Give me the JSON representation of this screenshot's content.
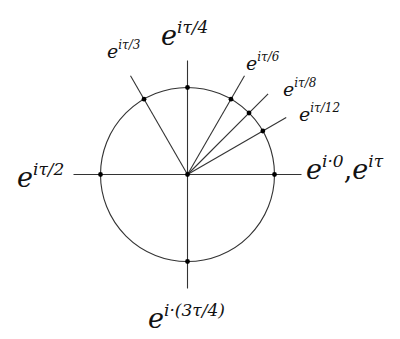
{
  "diagram": {
    "center": {
      "x": 187.5,
      "y": 174.5
    },
    "radius": 87,
    "ray_length": 114,
    "line_color": "#333333",
    "point_color": "#000000",
    "rays": [
      {
        "angle_deg": 0,
        "label": "e^{i·0}, e^{iτ}"
      },
      {
        "angle_deg": 30,
        "label": "e^{iτ/12}"
      },
      {
        "angle_deg": 45,
        "label": "e^{iτ/8}"
      },
      {
        "angle_deg": 60,
        "label": "e^{iτ/6}"
      },
      {
        "angle_deg": 90,
        "label": "e^{iτ/4}"
      },
      {
        "angle_deg": 120,
        "label": "e^{iτ/3}"
      },
      {
        "angle_deg": 180,
        "label": "e^{iτ/2}"
      },
      {
        "angle_deg": 270,
        "label": "e^{i·(3τ/4)}"
      }
    ]
  },
  "labels": {
    "tau_4": {
      "base": "e",
      "exp": "iτ/4"
    },
    "tau_3": {
      "base": "e",
      "exp": "iτ/3"
    },
    "tau_6": {
      "base": "e",
      "exp": "iτ/6"
    },
    "tau_8": {
      "base": "e",
      "exp": "iτ/8"
    },
    "tau_12": {
      "base": "e",
      "exp": "iτ/12"
    },
    "tau_2": {
      "base": "e",
      "exp": "iτ/2"
    },
    "zero": {
      "base": "e",
      "exp": "i·0",
      "sep": ",",
      "base2": "e",
      "exp2": "iτ"
    },
    "three_tau_4": {
      "base": "e",
      "exp": "i·(3τ/4)"
    }
  }
}
